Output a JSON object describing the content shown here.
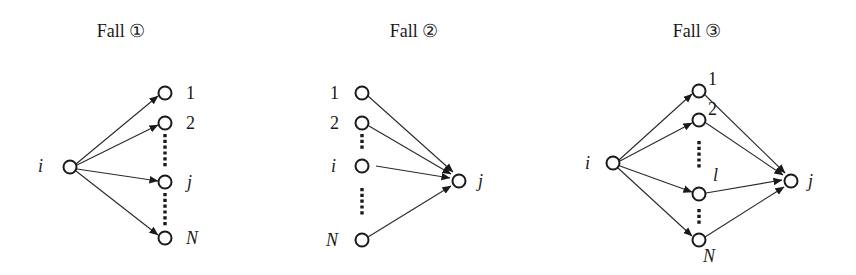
{
  "panels": [
    {
      "title": "Fall ①",
      "labels": {
        "source": "i",
        "n1": "1",
        "n2": "2",
        "nj": "j",
        "nN": "N"
      }
    },
    {
      "title": "Fall ②",
      "labels": {
        "n1": "1",
        "n2": "2",
        "ni": "i",
        "nN": "N",
        "target": "j"
      }
    },
    {
      "title": "Fall ③",
      "labels": {
        "source": "i",
        "n1": "1",
        "n2": "2",
        "nl": "l",
        "nN": "N",
        "target": "j"
      }
    }
  ],
  "colors": {
    "stroke": "#1a1a1a",
    "background": "#ffffff"
  }
}
